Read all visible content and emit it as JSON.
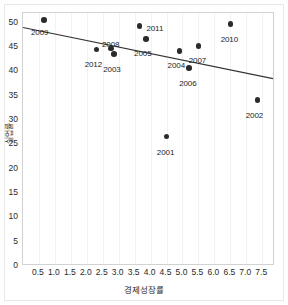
{
  "chart_data": {
    "type": "scatter",
    "title": "",
    "xlabel": "경제성장률",
    "ylabel": "실업률",
    "xlim": [
      0.0,
      7.9
    ],
    "ylim": [
      0,
      52
    ],
    "grid": "vertical-only",
    "legend": "none",
    "xticks": [
      "0.5",
      "1.0",
      "1.5",
      "2.0",
      "2.5",
      "3.0",
      "3.5",
      "4.0",
      "4.5",
      "5.0",
      "5.5",
      "6.0",
      "6.5",
      "7.0",
      "7.5"
    ],
    "xtick_values": [
      0.5,
      1.0,
      1.5,
      2.0,
      2.5,
      3.0,
      3.5,
      4.0,
      4.5,
      5.0,
      5.5,
      6.0,
      6.5,
      7.0,
      7.5
    ],
    "yticks": [
      "0",
      "5",
      "10",
      "15",
      "20",
      "25",
      "30",
      "35",
      "40",
      "45",
      "50"
    ],
    "ytick_values": [
      0,
      5,
      10,
      15,
      20,
      25,
      30,
      35,
      40,
      45,
      50
    ],
    "marker_color": "#2b2b2b",
    "line_color": "#333333",
    "points": [
      {
        "label": "2009",
        "x": 0.65,
        "y": 50.6,
        "label_dx": -4,
        "label_dy": 9
      },
      {
        "label": "2012",
        "x": 2.3,
        "y": 44.5,
        "label_dx": -3,
        "label_dy": 12
      },
      {
        "label": "2008",
        "x": 2.75,
        "y": 44.7,
        "label_dx": 0,
        "label_dy": -8
      },
      {
        "label": "2003",
        "x": 2.85,
        "y": 43.6,
        "label_dx": -2,
        "label_dy": 12
      },
      {
        "label": "2011",
        "x": 3.65,
        "y": 49.3,
        "label_dx": 7,
        "label_dy": 3
      },
      {
        "label": "2005",
        "x": 3.85,
        "y": 46.6,
        "label_dx": -3,
        "label_dy": 11
      },
      {
        "label": "2004",
        "x": 4.9,
        "y": 44.2,
        "label_dx": -3,
        "label_dy": 11
      },
      {
        "label": "2007",
        "x": 5.5,
        "y": 45.2,
        "label_dx": -1,
        "label_dy": 11
      },
      {
        "label": "2006",
        "x": 5.2,
        "y": 40.7,
        "label_dx": -1,
        "label_dy": 12
      },
      {
        "label": "2010",
        "x": 6.5,
        "y": 49.7,
        "label_dx": -1,
        "label_dy": 12
      },
      {
        "label": "2002",
        "x": 7.35,
        "y": 34.1,
        "label_dx": -3,
        "label_dy": 12
      },
      {
        "label": "2001",
        "x": 4.5,
        "y": 26.6,
        "label_dx": -1,
        "label_dy": 12
      }
    ],
    "trendline": {
      "x_start": 0.0,
      "y_start": 49.0,
      "x_end": 7.9,
      "y_end": 38.4
    }
  }
}
